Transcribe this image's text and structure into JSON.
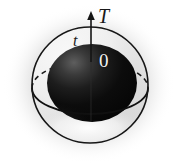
{
  "figure": {
    "background_color": "#ffffff",
    "labels": {
      "axis_top": "T",
      "axis_side": "t",
      "origin": "0"
    },
    "colors": {
      "outline": "#1a1a1a",
      "sphere_dark": "#0a0a0a",
      "sphere_mid": "#3a3a3a",
      "halo": "#b9b9b9",
      "label_light": "#f2f2f2",
      "label_dark": "#181818"
    },
    "geometry": {
      "outer_circle": {
        "cx": 90,
        "cy": 85,
        "r": 58
      },
      "inner_sphere": {
        "cx": 92,
        "cy": 83,
        "rx": 45,
        "ry": 39
      },
      "equator_ellipse": {
        "cx": 90,
        "cy": 88,
        "rx": 58,
        "ry": 26
      },
      "axis_line": {
        "x": 91,
        "y_top": 12,
        "y_bottom": 122
      },
      "arrow_tip": {
        "x": 91,
        "y": 12
      }
    }
  }
}
